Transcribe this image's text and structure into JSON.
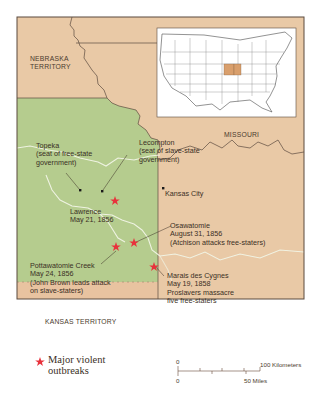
{
  "map": {
    "title": "Bleeding Kansas",
    "colors": {
      "kansas_territory": "#b5cc8e",
      "surrounding": "#e9c9a6",
      "rivers": "#f2f5e6",
      "inset_bg": "#ffffff",
      "highlight": "#d99f6c",
      "violence_marker": "#e8323c",
      "border": "#5b4a3f"
    },
    "regions": {
      "nebraska": [
        "NEBRASKA",
        "TERRITORY"
      ],
      "missouri": "MISSOURI",
      "kansas": "KANSAS TERRITORY"
    },
    "places": {
      "topeka": {
        "name": "Topeka",
        "note": [
          "(seat of free-state",
          "government)"
        ]
      },
      "lecompton": {
        "name": "Lecompton",
        "note": [
          "(seat of slave-state",
          "government)"
        ]
      },
      "kansas_city": {
        "name": "Kansas City"
      },
      "lawrence": {
        "name": "Lawrence",
        "date": "May 21, 1856"
      },
      "osawatomie": {
        "name": "Osawatomie",
        "date": "August 31, 1856",
        "note": "(Atchison attacks free-staters)"
      },
      "pottawatomie": {
        "name": "Pottawatomie Creek",
        "date": "May 24, 1856",
        "note": [
          "(John Brown leads attack",
          "on slave-staters)"
        ]
      },
      "marais": {
        "name": "Marais des Cygnes",
        "date": "May 19, 1858",
        "note": [
          "Proslavers massacre",
          "five free-staters"
        ]
      }
    },
    "legend": {
      "icon": "violence-star-icon",
      "label": [
        "Major violent",
        "outbreaks"
      ]
    },
    "scale": {
      "zero_km": "0",
      "zero_mi": "0",
      "km_label": "100 Kilometers",
      "mi_label": "50 Miles"
    }
  }
}
